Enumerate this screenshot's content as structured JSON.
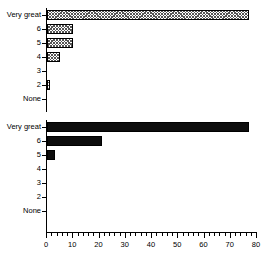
{
  "chart_data": [
    {
      "type": "bar",
      "orientation": "horizontal",
      "panel": "top",
      "title": "",
      "xlabel": "",
      "ylabel": "",
      "categories": [
        "Very great",
        "6",
        "5",
        "4",
        "3",
        "2",
        "None"
      ],
      "values": [
        77,
        10,
        10,
        5,
        0,
        1,
        0
      ],
      "fill": "crosshatch",
      "xlim": [
        0,
        80
      ],
      "xticks": [
        0,
        10,
        20,
        30,
        40,
        50,
        60,
        70,
        80
      ],
      "xtick_labels": [
        "0",
        "10",
        "20",
        "30",
        "40",
        "50",
        "60",
        "70",
        "80"
      ],
      "minor_tick_interval": 2,
      "grid": false,
      "legend": false
    },
    {
      "type": "bar",
      "orientation": "horizontal",
      "panel": "bottom",
      "title": "",
      "xlabel": "",
      "ylabel": "",
      "categories": [
        "Very great",
        "6",
        "5",
        "4",
        "3",
        "2",
        "None"
      ],
      "values": [
        77,
        21,
        3,
        0,
        0,
        0,
        0
      ],
      "fill": "solid",
      "xlim": [
        0,
        80
      ],
      "xticks": [
        0,
        10,
        20,
        30,
        40,
        50,
        60,
        70,
        80
      ],
      "xtick_labels": [
        "0",
        "10",
        "20",
        "30",
        "40",
        "50",
        "60",
        "70",
        "80"
      ],
      "minor_tick_interval": 2,
      "grid": false,
      "legend": false
    }
  ],
  "axis": {
    "x_min": 0,
    "x_max": 80,
    "major_step": 10,
    "minor_step": 2,
    "tick_labels": [
      "0",
      "10",
      "20",
      "30",
      "40",
      "50",
      "60",
      "70",
      "80"
    ]
  },
  "colors": {
    "background": "#ffffff",
    "axis": "#000000",
    "bar_solid": "#0d0d0d",
    "bar_hatch_line": "#555555",
    "bar_outline": "#000000",
    "text": "#000000"
  }
}
